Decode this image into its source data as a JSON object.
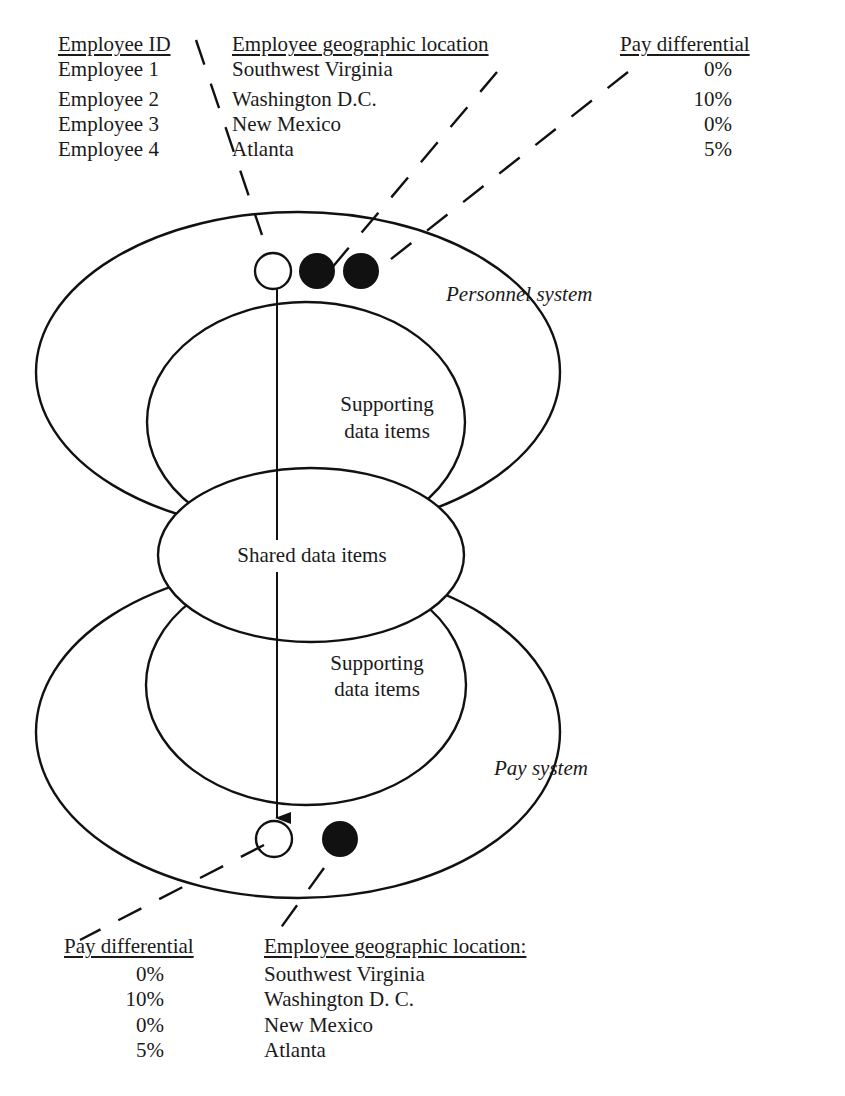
{
  "top_table": {
    "headers": {
      "employee_id": "Employee ID",
      "location": "Employee geographic location",
      "pay_differential": "Pay differential"
    },
    "rows": [
      {
        "employee_id": "Employee 1",
        "location": "Southwest Virginia",
        "pay_differential": "0%"
      },
      {
        "employee_id": "Employee 2",
        "location": "Washington D.C.",
        "pay_differential": "10%"
      },
      {
        "employee_id": "Employee 3",
        "location": "New Mexico",
        "pay_differential": "0%"
      },
      {
        "employee_id": "Employee 4",
        "location": "Atlanta",
        "pay_differential": "5%"
      }
    ]
  },
  "diagram": {
    "personnel_system_label": "Personnel system",
    "pay_system_label": "Pay system",
    "upper_supporting_label_line1": "Supporting",
    "upper_supporting_label_line2": "data items",
    "shared_label": "Shared data items",
    "lower_supporting_label_line1": "Supporting",
    "lower_supporting_label_line2": "data items",
    "top_markers": [
      "open-circle",
      "filled-circle",
      "filled-circle"
    ],
    "bottom_markers": [
      "open-circle",
      "filled-circle"
    ]
  },
  "bottom_table": {
    "headers": {
      "pay_differential": "Pay differential",
      "location": "Employee geographic location:"
    },
    "rows": [
      {
        "pay_differential": "0%",
        "location": "Southwest Virginia"
      },
      {
        "pay_differential": "10%",
        "location": "Washington D. C."
      },
      {
        "pay_differential": "0%",
        "location": "New Mexico"
      },
      {
        "pay_differential": "5%",
        "location": "Atlanta"
      }
    ]
  }
}
